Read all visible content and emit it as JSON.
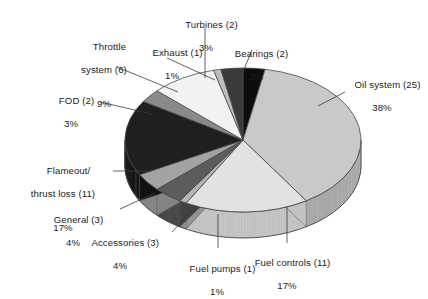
{
  "chart_data": {
    "type": "pie",
    "title": "",
    "subtitle": "",
    "xlabel": "",
    "ylabel": "",
    "legend_position": "labels-with-leader-lines",
    "grid": false,
    "style": "3d-exploded-none",
    "total_count": 66,
    "value_unit": "count",
    "categories": [
      "Bearings",
      "Oil system",
      "Fuel controls",
      "Fuel pumps",
      "Accessories",
      "General",
      "Flameout/thrust loss",
      "FOD",
      "Throttle system",
      "Exhaust",
      "Turbines"
    ],
    "values": [
      2,
      25,
      11,
      1,
      3,
      3,
      11,
      2,
      6,
      1,
      2
    ],
    "percentages": [
      3,
      38,
      17,
      1,
      4,
      4,
      17,
      3,
      9,
      1,
      3
    ],
    "slices": [
      {
        "name": "Bearings",
        "count": 2,
        "percent": 3,
        "label": "Bearings (2)",
        "pct_text": "3%",
        "color": "#0d0d0d",
        "side_color": "#000000"
      },
      {
        "name": "Oil system",
        "count": 25,
        "percent": 38,
        "label": "Oil system (25)",
        "pct_text": "38%",
        "color": "#c9c9c9",
        "side_color": "#a8a8a8"
      },
      {
        "name": "Fuel controls",
        "count": 11,
        "percent": 17,
        "label": "Fuel controls (11)",
        "pct_text": "17%",
        "color": "#e2e2e2",
        "side_color": "#c2c2c2"
      },
      {
        "name": "Fuel pumps",
        "count": 1,
        "percent": 1,
        "label": "Fuel pumps (1)",
        "pct_text": "1%",
        "color": "#b5b5b5",
        "side_color": "#949494"
      },
      {
        "name": "Accessories",
        "count": 3,
        "percent": 4,
        "label": "Accessories (3)",
        "pct_text": "4%",
        "color": "#5c5c5c",
        "side_color": "#424242"
      },
      {
        "name": "General",
        "count": 3,
        "percent": 4,
        "label": "General (3)",
        "pct_text": "4%",
        "color": "#a3a3a3",
        "side_color": "#848484"
      },
      {
        "name": "Flameout/thrust loss",
        "count": 11,
        "percent": 17,
        "label": "Flameout/\nthrust loss (11)",
        "pct_text": "17%",
        "color": "#1f1f1f",
        "side_color": "#111111"
      },
      {
        "name": "FOD",
        "count": 2,
        "percent": 3,
        "label": "FOD (2)",
        "pct_text": "3%",
        "color": "#8a8a8a",
        "side_color": "#6e6e6e"
      },
      {
        "name": "Throttle system",
        "count": 6,
        "percent": 9,
        "label": "Throttle\nsystem (6)",
        "pct_text": "9%",
        "color": "#f2f2f2",
        "side_color": "#d0d0d0"
      },
      {
        "name": "Exhaust",
        "count": 1,
        "percent": 1,
        "label": "Exhaust (1)",
        "pct_text": "1%",
        "color": "#bdbdbd",
        "side_color": "#9c9c9c"
      },
      {
        "name": "Turbines",
        "count": 2,
        "percent": 3,
        "label": "Turbines (2)",
        "pct_text": "3%",
        "color": "#3a3a3a",
        "side_color": "#262626"
      }
    ]
  },
  "labels": {
    "turbines": {
      "name": "Turbines (2)",
      "pct": "3%"
    },
    "throttle_1": "Throttle",
    "throttle_2": "system (6)",
    "throttle_pct": "9%",
    "exhaust": {
      "name": "Exhaust (1)",
      "pct": "1%"
    },
    "bearings": {
      "name": "Bearings (2)",
      "pct": "3%"
    },
    "oil": {
      "name": "Oil system (25)",
      "pct": "38%"
    },
    "fod": {
      "name": "FOD (2)",
      "pct": "3%"
    },
    "flameout_1": "Flameout/",
    "flameout_2": "thrust loss (11)",
    "flameout_pct": "17%",
    "general": {
      "name": "General (3)",
      "pct": "4%"
    },
    "accessories": {
      "name": "Accessories (3)",
      "pct": "4%"
    },
    "fuelpumps": {
      "name": "Fuel pumps (1)",
      "pct": "1%"
    },
    "fuelcontrols": {
      "name": "Fuel controls (11)",
      "pct": "17%"
    }
  },
  "geometry": {
    "cx": 243,
    "cy": 140,
    "rx": 118,
    "ry": 72,
    "depth": 26
  }
}
